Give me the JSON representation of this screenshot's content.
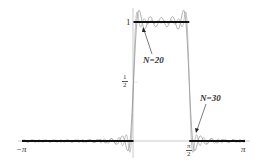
{
  "chart_data": {
    "type": "line",
    "title": "",
    "xlabel": "",
    "ylabel": "",
    "xlim": [
      -3.14159,
      3.14159
    ],
    "ylim": [
      -0.15,
      1.12
    ],
    "grid": false,
    "legend": "none",
    "x_ticks": [
      {
        "value": -3.14159,
        "label": "−π"
      },
      {
        "value": 1.5708,
        "label": "π/2"
      },
      {
        "value": 3.14159,
        "label": "π"
      }
    ],
    "y_ticks": [
      {
        "value": 1,
        "label": "1"
      },
      {
        "value": 0.5,
        "label": "1/2"
      }
    ],
    "series": [
      {
        "name": "f(x) square pulse",
        "description": "1 on (0, π/2), 0 elsewhere on (−π, π)",
        "style": "thick black"
      },
      {
        "name": "N=20",
        "description": "Fourier partial sum with Gibbs overshoot",
        "style": "thin gray"
      },
      {
        "name": "N=30",
        "description": "Fourier partial sum with Gibbs overshoot",
        "style": "thin gray"
      }
    ],
    "annotations": [
      {
        "text": "N=20",
        "arrow_to": "overshoot near top-left of pulse"
      },
      {
        "text": "N=30",
        "arrow_to": "oscillation just right of π/2"
      }
    ]
  },
  "labels": {
    "neg_pi": "−π",
    "pi": "π",
    "one": "1",
    "half_num": "1",
    "half_den": "2",
    "pihalf_num": "π",
    "pihalf_den": "2",
    "n20": "N=20",
    "n30": "N=30"
  }
}
